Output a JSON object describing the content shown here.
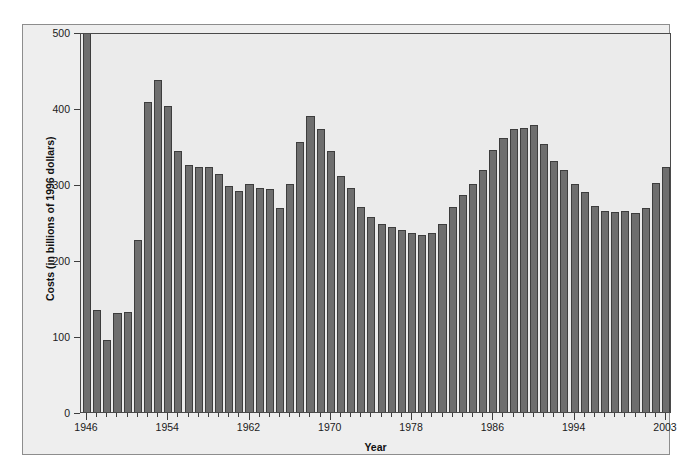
{
  "chart_data": {
    "type": "bar",
    "title": "",
    "xlabel": "Year",
    "ylabel": "Costs (in billions of 1996 dollars)",
    "ylim": [
      0,
      500
    ],
    "yticks": [
      0,
      100,
      200,
      300,
      400,
      500
    ],
    "xlim": [
      1946,
      2003
    ],
    "xticks": [
      1946,
      1954,
      1962,
      1970,
      1978,
      1986,
      1994,
      2003
    ],
    "xtick_labels": [
      "1946",
      "1954",
      "1962",
      "1970",
      "1978",
      "1986",
      "1994",
      "2003"
    ],
    "grid": false,
    "legend": null,
    "bar_color": "#6e6e6e",
    "bar_edge_color": "#3d3d3d",
    "plot_background": "#ebebeb",
    "figure_background": "#eeeeee",
    "categories": [
      "1946",
      "1947",
      "1948",
      "1949",
      "1950",
      "1951",
      "1952",
      "1953",
      "1954",
      "1955",
      "1956",
      "1957",
      "1958",
      "1959",
      "1960",
      "1961",
      "1962",
      "1963",
      "1964",
      "1965",
      "1966",
      "1967",
      "1968",
      "1969",
      "1970",
      "1971",
      "1972",
      "1973",
      "1974",
      "1975",
      "1976",
      "1977",
      "1978",
      "1979",
      "1980",
      "1981",
      "1982",
      "1983",
      "1984",
      "1985",
      "1986",
      "1987",
      "1988",
      "1989",
      "1990",
      "1991",
      "1992",
      "1993",
      "1994",
      "1995",
      "1996",
      "1997",
      "1998",
      "1999",
      "2000",
      "2001",
      "2002",
      "2003"
    ],
    "values": [
      520,
      134,
      95,
      130,
      132,
      226,
      408,
      437,
      403,
      344,
      325,
      322,
      323,
      313,
      297,
      291,
      300,
      295,
      294,
      269,
      300,
      355,
      390,
      373,
      344,
      311,
      295,
      270,
      256,
      248,
      243,
      240,
      236,
      233,
      236,
      247,
      270,
      285,
      300,
      319,
      345,
      361,
      372,
      374,
      377,
      353,
      330,
      319,
      300,
      289,
      271,
      265,
      263,
      265,
      262,
      269,
      301,
      322
    ]
  }
}
